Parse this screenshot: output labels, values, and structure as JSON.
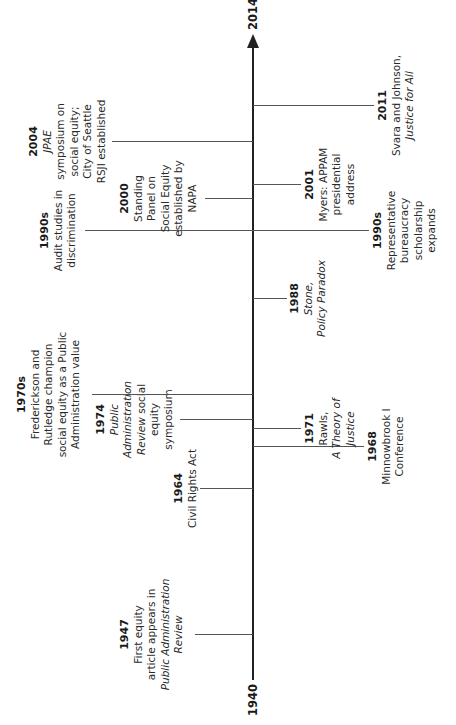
{
  "axis": {
    "start_label": "1940",
    "end_label": "2014",
    "start_year": 1940,
    "end_year": 2014
  },
  "events": [
    {
      "year": 1947,
      "year_label": "1947",
      "side": "left",
      "lines": [
        {
          "t": "First equity"
        },
        {
          "t": "article appears in"
        },
        {
          "t": "Public Administration",
          "i": true
        },
        {
          "t": "Review",
          "i": true
        }
      ]
    },
    {
      "year": 1964,
      "year_label": "1964",
      "side": "left",
      "lines": [
        {
          "t": "Civil Rights Act"
        }
      ]
    },
    {
      "year": 1974,
      "year_label": "1974",
      "side": "left",
      "lines": [
        {
          "t": "Public",
          "i": true
        },
        {
          "t": "Administration",
          "i": true
        },
        {
          "t": "Review social",
          "mix": [
            {
              "t": "Review",
              "i": true
            },
            {
              "t": " social"
            }
          ]
        },
        {
          "t": "equity"
        },
        {
          "t": "symposium"
        }
      ]
    },
    {
      "year": 1977,
      "year_label": "1970s",
      "side": "left",
      "lines": [
        {
          "t": "Frederickson and"
        },
        {
          "t": "Rutledge champion"
        },
        {
          "t": "social equity as a Public"
        },
        {
          "t": "Administration value"
        }
      ]
    },
    {
      "year": 1995,
      "year_label": "1990s",
      "side": "left",
      "lines": [
        {
          "t": "Audit studies in"
        },
        {
          "t": "discrimination"
        }
      ]
    },
    {
      "year": 2000,
      "year_label": "2000",
      "side": "left",
      "lines": [
        {
          "t": "Standing"
        },
        {
          "t": "Panel on"
        },
        {
          "t": "Social Equity"
        },
        {
          "t": "established by"
        },
        {
          "t": "NAPA"
        }
      ]
    },
    {
      "year": 2004,
      "year_label": "2004",
      "side": "left",
      "lines": [
        {
          "t": "JPAE",
          "i": true
        },
        {
          "t": "symposium on"
        },
        {
          "t": "social equity;"
        },
        {
          "t": "City of Seattle"
        },
        {
          "t": "RSJI established"
        }
      ]
    },
    {
      "year": 1968,
      "year_label": "1968",
      "side": "right",
      "lines": [
        {
          "t": "Minnowbrook I"
        },
        {
          "t": "Conference"
        }
      ]
    },
    {
      "year": 1971,
      "year_label": "1971",
      "side": "right",
      "lines": [
        {
          "t": "Rawls,"
        },
        {
          "t": "A Theory of",
          "i": true
        },
        {
          "t": "Justice",
          "i": true
        }
      ]
    },
    {
      "year": 1988,
      "year_label": "1988",
      "side": "right",
      "lines": [
        {
          "t": "Stone,",
          "i": true
        },
        {
          "t": "Policy Paradox",
          "i": true
        }
      ]
    },
    {
      "year": 1995,
      "year_label": "1990s",
      "side": "right",
      "lines": [
        {
          "t": "Representative"
        },
        {
          "t": "bureaucracy"
        },
        {
          "t": "scholarship"
        },
        {
          "t": "expands"
        }
      ]
    },
    {
      "year": 2001,
      "year_label": "2001",
      "side": "right",
      "lines": [
        {
          "t": "Myers: APPAM"
        },
        {
          "t": "presidential"
        },
        {
          "t": "address"
        }
      ]
    },
    {
      "year": 2011,
      "year_label": "2011",
      "side": "right",
      "lines": [
        {
          "t": "Svara and Johnson,"
        },
        {
          "t": "Justice for All",
          "i": true
        }
      ]
    }
  ]
}
